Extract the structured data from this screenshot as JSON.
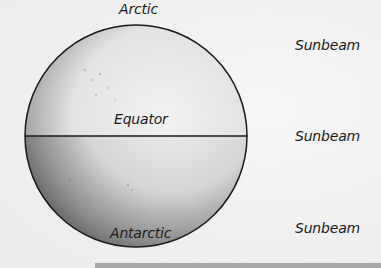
{
  "diagram": {
    "globe": {
      "labels": {
        "top": "Arctic",
        "middle": "Equator",
        "bottom": "Antarctic"
      }
    },
    "sunbeams": [
      {
        "label": "Sunbeam"
      },
      {
        "label": "Sunbeam"
      },
      {
        "label": "Sunbeam"
      }
    ]
  },
  "colors": {
    "outline": "#1a1a1a",
    "globe_light": "#f2f2f2",
    "globe_dark": "#5a5a5a",
    "bar": "#a8a8a8"
  }
}
